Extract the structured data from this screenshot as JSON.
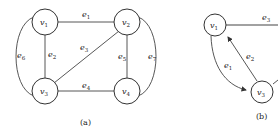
{
  "figure_a": {
    "caption": "(a)",
    "vertices": [
      {
        "id": "v1",
        "base": "v",
        "sub": "1"
      },
      {
        "id": "v2",
        "base": "v",
        "sub": "2"
      },
      {
        "id": "v3",
        "base": "v",
        "sub": "3"
      },
      {
        "id": "v4",
        "base": "v",
        "sub": "4"
      }
    ],
    "edges": [
      {
        "id": "e1",
        "base": "e",
        "sub": "1",
        "from": "v1",
        "to": "v2"
      },
      {
        "id": "e2",
        "base": "e",
        "sub": "2",
        "from": "v1",
        "to": "v3"
      },
      {
        "id": "e3",
        "base": "e",
        "sub": "3",
        "from": "v3",
        "to": "v2"
      },
      {
        "id": "e4",
        "base": "e",
        "sub": "4",
        "from": "v3",
        "to": "v4"
      },
      {
        "id": "e5",
        "base": "e",
        "sub": "5",
        "from": "v2",
        "to": "v4"
      },
      {
        "id": "e6",
        "base": "e",
        "sub": "6",
        "from": "v1",
        "to": "v3"
      },
      {
        "id": "e7",
        "base": "e",
        "sub": "7",
        "from": "v2",
        "to": "v4"
      }
    ]
  },
  "figure_b": {
    "caption": "(b)",
    "vertices": [
      {
        "id": "v1",
        "base": "v",
        "sub": "1"
      },
      {
        "id": "v3",
        "base": "v",
        "sub": "3"
      }
    ],
    "edges": [
      {
        "id": "e1",
        "base": "e",
        "sub": "1",
        "from": "v1",
        "to": "v3",
        "directed": true
      },
      {
        "id": "e2",
        "base": "e",
        "sub": "2",
        "from": "v3",
        "to": "v1",
        "directed": true
      },
      {
        "id": "e3",
        "base": "e",
        "sub": "3",
        "from": "v1",
        "to": "right"
      }
    ]
  }
}
